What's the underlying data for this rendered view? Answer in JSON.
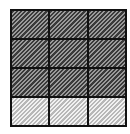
{
  "diagram": {
    "type": "fraction-grid",
    "rows": 4,
    "columns": 3,
    "total_cells": 12,
    "shaded_cells": 9,
    "unshaded_cells": 3,
    "cells": [
      {
        "row": 1,
        "col": 1,
        "state": "shaded"
      },
      {
        "row": 1,
        "col": 2,
        "state": "shaded"
      },
      {
        "row": 1,
        "col": 3,
        "state": "shaded"
      },
      {
        "row": 2,
        "col": 1,
        "state": "shaded"
      },
      {
        "row": 2,
        "col": 2,
        "state": "shaded"
      },
      {
        "row": 2,
        "col": 3,
        "state": "shaded"
      },
      {
        "row": 3,
        "col": 1,
        "state": "shaded"
      },
      {
        "row": 3,
        "col": 2,
        "state": "shaded"
      },
      {
        "row": 3,
        "col": 3,
        "state": "shaded"
      },
      {
        "row": 4,
        "col": 1,
        "state": "light"
      },
      {
        "row": 4,
        "col": 2,
        "state": "light"
      },
      {
        "row": 4,
        "col": 3,
        "state": "light"
      }
    ],
    "colors": {
      "border": "#111111",
      "shaded_dark": "#3a3a3a",
      "shaded_light": "#9a9a9a",
      "light_dark": "#b8b8b8",
      "light_light": "#f2f2f2"
    }
  }
}
